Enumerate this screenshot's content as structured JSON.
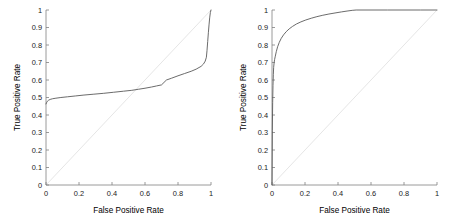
{
  "figure": {
    "background": "#ffffff",
    "curve_color": "#5a5a5a",
    "reference_line_color": "#e2e2e2",
    "axis_color": "#808080"
  },
  "panels": [
    {
      "name": "left-roc-plot",
      "axis": {
        "xlabel": "False Positive Rate",
        "ylabel": "True Positive Rate",
        "xticks": [
          "0",
          "0.2",
          "0.4",
          "0.6",
          "0.8",
          "1"
        ],
        "xtick_values": [
          0,
          0.2,
          0.4,
          0.6,
          0.8,
          1
        ],
        "yticks": [
          "0",
          "0.1",
          "0.2",
          "0.3",
          "0.4",
          "0.5",
          "0.6",
          "0.7",
          "0.8",
          "0.9",
          "1"
        ],
        "ytick_values": [
          0,
          0.1,
          0.2,
          0.3,
          0.4,
          0.5,
          0.6,
          0.7,
          0.8,
          0.9,
          1
        ],
        "xlim": [
          0,
          1
        ],
        "ylim": [
          0,
          1
        ]
      }
    },
    {
      "name": "right-roc-plot",
      "axis": {
        "xlabel": "False Positive Rate",
        "ylabel": "True Positive Rate",
        "xticks": [
          "0",
          "0.2",
          "0.4",
          "0.6",
          "0.8",
          "1"
        ],
        "xtick_values": [
          0,
          0.2,
          0.4,
          0.6,
          0.8,
          1
        ],
        "yticks": [
          "0",
          "0.1",
          "0.2",
          "0.3",
          "0.4",
          "0.5",
          "0.6",
          "0.7",
          "0.8",
          "0.9",
          "1"
        ],
        "ytick_values": [
          0,
          0.1,
          0.2,
          0.3,
          0.4,
          0.5,
          0.6,
          0.7,
          0.8,
          0.9,
          1
        ],
        "xlim": [
          0,
          1
        ],
        "ylim": [
          0,
          1
        ]
      }
    }
  ],
  "chart_data": [
    {
      "type": "line",
      "title": "",
      "xlabel": "False Positive Rate",
      "ylabel": "True Positive Rate",
      "xlim": [
        0,
        1
      ],
      "ylim": [
        0,
        1
      ],
      "grid": false,
      "legend": "none",
      "series": [
        {
          "name": "ROC curve (weak classifier)",
          "x": [
            0.0,
            0.003,
            0.008,
            0.015,
            0.025,
            0.04,
            0.06,
            0.09,
            0.13,
            0.18,
            0.23,
            0.29,
            0.35,
            0.41,
            0.47,
            0.52,
            0.56,
            0.6,
            0.64,
            0.67,
            0.7,
            0.715,
            0.73,
            0.76,
            0.8,
            0.84,
            0.88,
            0.91,
            0.94,
            0.955,
            0.965,
            0.972,
            0.976,
            0.98,
            0.984,
            0.988,
            0.992,
            0.996,
            1.0
          ],
          "y": [
            0.463,
            0.47,
            0.478,
            0.484,
            0.489,
            0.493,
            0.496,
            0.5,
            0.504,
            0.509,
            0.514,
            0.519,
            0.524,
            0.53,
            0.536,
            0.541,
            0.547,
            0.553,
            0.56,
            0.566,
            0.572,
            0.586,
            0.6,
            0.61,
            0.624,
            0.637,
            0.65,
            0.662,
            0.678,
            0.692,
            0.708,
            0.73,
            0.77,
            0.82,
            0.87,
            0.915,
            0.955,
            0.985,
            1.0
          ]
        },
        {
          "name": "chance reference diagonal",
          "x": [
            0,
            1
          ],
          "y": [
            0,
            1
          ]
        }
      ]
    },
    {
      "type": "line",
      "title": "",
      "xlabel": "False Positive Rate",
      "ylabel": "True Positive Rate",
      "xlim": [
        0,
        1
      ],
      "ylim": [
        0,
        1
      ],
      "grid": false,
      "legend": "none",
      "series": [
        {
          "name": "ROC curve (strong classifier)",
          "x": [
            0.0,
            0.002,
            0.004,
            0.006,
            0.008,
            0.01,
            0.013,
            0.016,
            0.02,
            0.026,
            0.034,
            0.044,
            0.056,
            0.07,
            0.086,
            0.104,
            0.124,
            0.148,
            0.175,
            0.205,
            0.238,
            0.272,
            0.308,
            0.345,
            0.382,
            0.42,
            0.455,
            0.486,
            0.51,
            0.6,
            0.7,
            0.8,
            0.9,
            1.0
          ],
          "y": [
            0.0,
            0.31,
            0.47,
            0.57,
            0.63,
            0.672,
            0.7,
            0.718,
            0.736,
            0.762,
            0.79,
            0.815,
            0.838,
            0.858,
            0.876,
            0.892,
            0.906,
            0.92,
            0.932,
            0.943,
            0.953,
            0.962,
            0.97,
            0.977,
            0.983,
            0.989,
            0.994,
            0.998,
            1.0,
            1.0,
            1.0,
            1.0,
            1.0,
            1.0
          ]
        },
        {
          "name": "chance reference diagonal",
          "x": [
            0,
            1
          ],
          "y": [
            0,
            1
          ]
        }
      ]
    }
  ]
}
